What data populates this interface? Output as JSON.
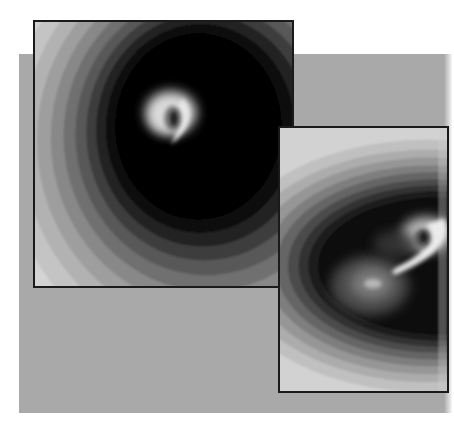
{
  "page": {
    "background_color": "#ffffff",
    "backdrop_color": "#a9a9a9",
    "border_color": "#1a1a1a"
  },
  "panels": [
    {
      "id": "panel-1",
      "description": "Grayscale contour-band image with a bright curled swirl (vortex) near the upper center",
      "band_colors": [
        "#d2d2d2",
        "#c2c2c2",
        "#b0b0b0",
        "#9c9c9c",
        "#868686",
        "#6e6e6e",
        "#565656",
        "#3c3c3c",
        "#222222",
        "#0c0c0c"
      ],
      "feature": "bright curled swirl with dark core"
    },
    {
      "id": "panel-2",
      "description": "Grayscale contour-band image with a bright hooked swirl on the right and a faint glow blob below-left",
      "band_colors": [
        "#d0d0d0",
        "#bebebe",
        "#aaaaaa",
        "#949494",
        "#7c7c7c",
        "#636363",
        "#4a4a4a",
        "#303030",
        "#181818",
        "#080808"
      ],
      "feature": "bright hooked swirl with dark core and a diffuse secondary glow"
    }
  ]
}
